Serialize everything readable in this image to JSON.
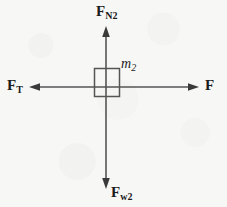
{
  "figure": {
    "background_color": "#f7f7f6",
    "stroke_color": "#555555",
    "text_color": "#1b1b1b",
    "width": 227,
    "height": 207
  },
  "body": {
    "name": "block",
    "mass_label": "m",
    "mass_subscript": "2",
    "box": {
      "x": 94,
      "y": 68,
      "width": 25,
      "height": 28
    }
  },
  "origin": {
    "x": 106,
    "y": 87
  },
  "forces": [
    {
      "id": "normal",
      "symbol": "F",
      "subscript": "N2",
      "direction": "up",
      "tail": {
        "x": 106,
        "y": 87
      },
      "tip": {
        "x": 106,
        "y": 27
      }
    },
    {
      "id": "tension",
      "symbol": "F",
      "subscript": "T",
      "direction": "left",
      "tail": {
        "x": 106,
        "y": 87
      },
      "tip": {
        "x": 30,
        "y": 87
      }
    },
    {
      "id": "applied",
      "symbol": "F",
      "subscript": "",
      "direction": "right",
      "tail": {
        "x": 106,
        "y": 87
      },
      "tip": {
        "x": 198,
        "y": 87
      }
    },
    {
      "id": "weight",
      "symbol": "F",
      "subscript": "w2",
      "direction": "down",
      "tail": {
        "x": 106,
        "y": 87
      },
      "tip": {
        "x": 106,
        "y": 189
      }
    }
  ]
}
